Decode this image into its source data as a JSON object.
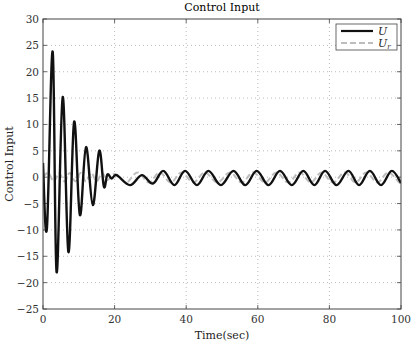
{
  "chart_data": {
    "type": "line",
    "title": "Control Input",
    "xlabel": "Time(sec)",
    "ylabel": "Control Input",
    "xlim": [
      0,
      100
    ],
    "ylim": [
      -25,
      30
    ],
    "xticks": [
      0,
      20,
      40,
      60,
      80,
      100
    ],
    "yticks": [
      30,
      25,
      20,
      15,
      10,
      5,
      0,
      -5,
      -10,
      -15,
      -20,
      -25
    ],
    "grid": true,
    "legend_position": "upper right",
    "series": [
      {
        "name": "U",
        "color": "#111111",
        "style": "solid",
        "points": [
          [
            0,
            2.7
          ],
          [
            1.1,
            -9.7
          ],
          [
            2.7,
            23.8
          ],
          [
            3.8,
            -18
          ],
          [
            5.5,
            15.2
          ],
          [
            7.1,
            -14.2
          ],
          [
            8.7,
            10.5
          ],
          [
            10.3,
            -7.2
          ],
          [
            12,
            5.7
          ],
          [
            13.9,
            -5.3
          ],
          [
            15.7,
            5
          ],
          [
            17,
            -1.8
          ],
          [
            18,
            0.5
          ],
          [
            19.2,
            -0.25
          ],
          [
            20.6,
            0.4
          ],
          [
            24.3,
            -1.5
          ],
          [
            27.6,
            0.4
          ],
          [
            30.7,
            -1.2
          ],
          [
            33.6,
            1.2
          ],
          [
            36.7,
            -1.5
          ],
          [
            39.7,
            1.2
          ],
          [
            43,
            -1.5
          ],
          [
            46.2,
            1.2
          ],
          [
            49.7,
            -1.5
          ],
          [
            53.2,
            1.2
          ],
          [
            56.5,
            -1.5
          ],
          [
            59.7,
            1.2
          ],
          [
            63,
            -1.5
          ],
          [
            66.2,
            1.2
          ],
          [
            69.5,
            -1.5
          ],
          [
            72.7,
            1.2
          ],
          [
            75.8,
            -1.5
          ],
          [
            78.8,
            1.2
          ],
          [
            82,
            -1.5
          ],
          [
            85.3,
            1.2
          ],
          [
            88.3,
            -1.5
          ],
          [
            91.3,
            1.2
          ],
          [
            94.4,
            -1.5
          ],
          [
            97.4,
            1.2
          ],
          [
            100,
            -1.1
          ]
        ]
      },
      {
        "name": "U_r",
        "color": "#bdbdbd",
        "style": "dashed",
        "points": [
          [
            0,
            0
          ],
          [
            1.5,
            0.8
          ],
          [
            3,
            -0.8
          ],
          [
            4.5,
            0.8
          ],
          [
            6,
            -0.8
          ],
          [
            7.5,
            0.8
          ],
          [
            9,
            -0.8
          ],
          [
            10.5,
            0.8
          ],
          [
            12,
            -0.8
          ],
          [
            13.5,
            0.8
          ],
          [
            15,
            -0.8
          ],
          [
            16.5,
            0.8
          ],
          [
            18,
            -0.6
          ],
          [
            20,
            0.6
          ],
          [
            23.2,
            -1
          ],
          [
            26.4,
            0.9
          ],
          [
            29.6,
            -1
          ],
          [
            32.6,
            0.9
          ],
          [
            35.7,
            -1
          ],
          [
            38.7,
            0.9
          ],
          [
            42,
            -1
          ],
          [
            45.2,
            0.9
          ],
          [
            48.7,
            -1
          ],
          [
            52.2,
            0.9
          ],
          [
            55.5,
            -1
          ],
          [
            58.7,
            0.9
          ],
          [
            62,
            -1
          ],
          [
            65.2,
            0.9
          ],
          [
            68.5,
            -1
          ],
          [
            71.7,
            0.9
          ],
          [
            74.8,
            -1
          ],
          [
            77.8,
            0.9
          ],
          [
            81,
            -1
          ],
          [
            84.3,
            0.9
          ],
          [
            87.3,
            -1
          ],
          [
            90.3,
            0.9
          ],
          [
            93.4,
            -1
          ],
          [
            96.4,
            0.9
          ],
          [
            99.5,
            -1
          ],
          [
            100,
            -0.8
          ]
        ]
      }
    ]
  },
  "legend": {
    "items": [
      {
        "label": "U",
        "sub": ""
      },
      {
        "label": "U",
        "sub": "r"
      }
    ]
  }
}
